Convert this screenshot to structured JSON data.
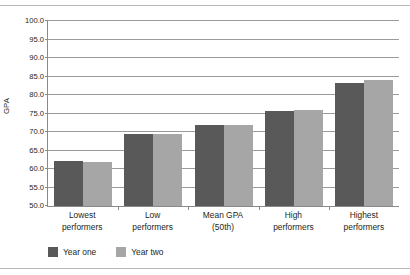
{
  "chart_data": {
    "type": "bar",
    "title": "",
    "subtitle": "",
    "xlabel": "",
    "ylabel": "GPA",
    "ylim": [
      50.0,
      100.0
    ],
    "ytick_step": 5.0,
    "yticks": [
      "100.0",
      "95.0",
      "90.0",
      "85.0",
      "80.0",
      "75.0",
      "70.0",
      "65.0",
      "60.0",
      "55.0",
      "50.0"
    ],
    "grid": "horizontal",
    "legend_position": "bottom-left",
    "categories": [
      "Lowest performers",
      "Low performers",
      "Mean GPA (50th)",
      "High performers",
      "Highest performers"
    ],
    "category_lines": [
      [
        "Lowest",
        "performers"
      ],
      [
        "Low",
        "performers"
      ],
      [
        "Mean GPA",
        "(50th)"
      ],
      [
        "High",
        "performers"
      ],
      [
        "Highest",
        "performers"
      ]
    ],
    "series": [
      {
        "name": "Year one",
        "color": "#595959",
        "values": [
          62.2,
          69.5,
          71.8,
          75.8,
          83.2
        ]
      },
      {
        "name": "Year two",
        "color": "#a6a6a6",
        "values": [
          61.8,
          69.5,
          71.9,
          75.9,
          84.0
        ]
      }
    ]
  },
  "legend": {
    "items": [
      {
        "label": "Year one",
        "color": "#595959"
      },
      {
        "label": "Year two",
        "color": "#a6a6a6"
      }
    ]
  },
  "colors": {
    "series_one": "#595959",
    "series_two": "#a6a6a6",
    "gridline": "#9a9a9a",
    "axis": "#8a8a8a",
    "text": "#231f20",
    "rule": "#b8b8b8",
    "background": "#ffffff"
  }
}
